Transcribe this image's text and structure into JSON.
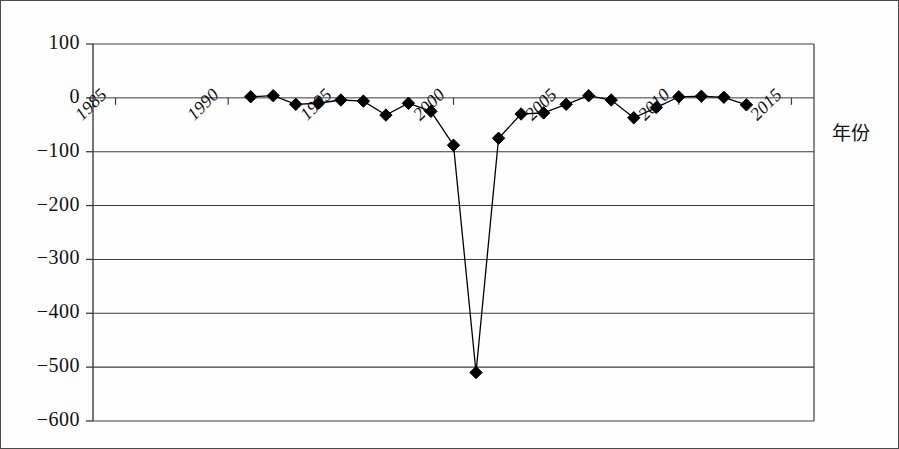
{
  "figure": {
    "background": "#fefefe",
    "frame_color": "#4a4a4a",
    "axis_title_right": "年份"
  },
  "chart_data": {
    "type": "line",
    "title": "",
    "xlabel": "年份",
    "ylabel": "",
    "xlim": [
      1984,
      2016
    ],
    "ylim": [
      -600,
      100
    ],
    "ytick_step": 100,
    "grid": true,
    "grid_axis": "y",
    "legend": "none",
    "marker": "diamond",
    "marker_color": "#000000",
    "line_color": "#000000",
    "xticks": [
      1985,
      1990,
      1995,
      2000,
      2005,
      2010,
      2015
    ],
    "xticklabels": [
      "1985",
      "1990",
      "1995",
      "2000",
      "2005",
      "2010",
      "2015"
    ],
    "yticks": [
      100,
      0,
      -100,
      -200,
      -300,
      -400,
      -500,
      -600
    ],
    "yticklabels": [
      "100",
      "0",
      "−100",
      "−200",
      "−300",
      "−400",
      "−500",
      "−600"
    ],
    "x": [
      1991,
      1992,
      1993,
      1994,
      1995,
      1996,
      1997,
      1998,
      1999,
      2000,
      2001,
      2002,
      2003,
      2004,
      2005,
      2006,
      2007,
      2008,
      2009,
      2010,
      2011,
      2012,
      2013
    ],
    "values": [
      2,
      4,
      -12,
      -10,
      -4,
      -6,
      -32,
      -10,
      -25,
      -88,
      -510,
      -75,
      -30,
      -28,
      -12,
      4,
      -4,
      -37,
      -18,
      2,
      3,
      1,
      -13
    ],
    "series": [
      {
        "name": "series-1",
        "x": [
          1991,
          1992,
          1993,
          1994,
          1995,
          1996,
          1997,
          1998,
          1999,
          2000,
          2001,
          2002,
          2003,
          2004,
          2005,
          2006,
          2007,
          2008,
          2009,
          2010,
          2011,
          2012,
          2013
        ],
        "values": [
          2,
          4,
          -12,
          -10,
          -4,
          -6,
          -32,
          -10,
          -25,
          -88,
          -510,
          -75,
          -30,
          -28,
          -12,
          4,
          -4,
          -37,
          -18,
          2,
          3,
          1,
          -13
        ]
      }
    ],
    "annotations": []
  }
}
